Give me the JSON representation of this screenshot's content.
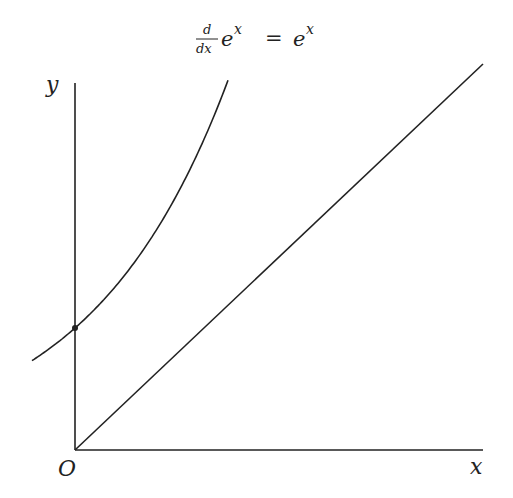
{
  "title": {
    "frac_num": "d",
    "frac_den": "dx",
    "base_left": "e",
    "exp_left": "x",
    "equals": "=",
    "base_right": "e",
    "exp_right": "x"
  },
  "axes": {
    "x_label": "x",
    "y_label": "y",
    "origin_label": "O"
  },
  "colors": {
    "stroke": "#222222",
    "background": "#ffffff"
  },
  "chart_data": {
    "type": "line",
    "xlabel": "x",
    "ylabel": "y",
    "series": [
      {
        "name": "y = e^x",
        "x": [
          -0.31,
          0,
          0.5,
          1.0,
          1.1
        ],
        "values": [
          0.73,
          1,
          1.65,
          2.72,
          3.0
        ]
      },
      {
        "name": "y = x",
        "x": [
          0,
          3.0
        ],
        "values": [
          0,
          3.0
        ]
      }
    ],
    "annotations": [
      "point (0,1) marked with dot",
      "origin labeled O"
    ],
    "grid": false
  }
}
